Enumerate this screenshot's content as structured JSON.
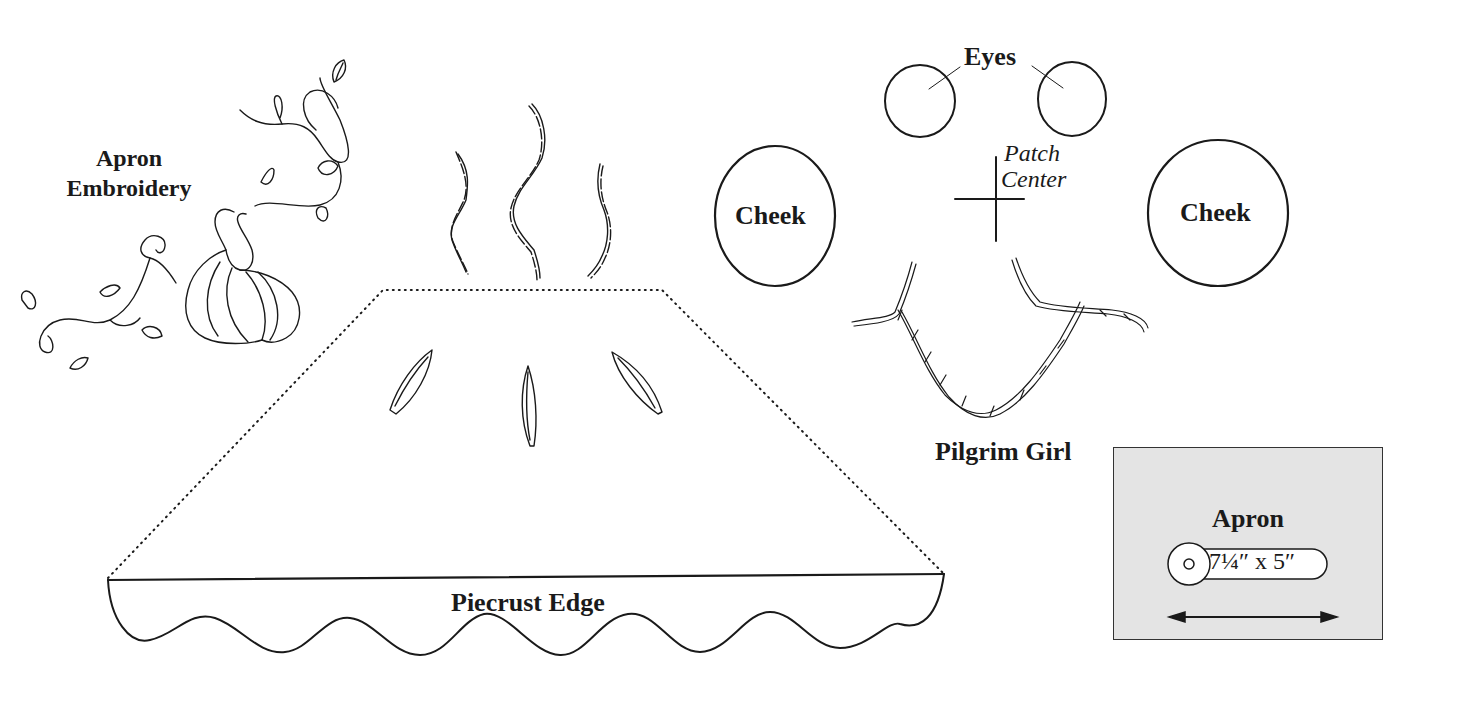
{
  "labels": {
    "apron_embroidery_line1": "Apron",
    "apron_embroidery_line2": "Embroidery",
    "eyes": "Eyes",
    "patch_center_line1": "Patch",
    "patch_center_line2": "Center",
    "cheek_left": "Cheek",
    "cheek_right": "Cheek",
    "pilgrim_girl": "Pilgrim Girl",
    "piecrust_edge": "Piecrust Edge"
  },
  "apron_card": {
    "title": "Apron",
    "size": "7¼″ x 5″",
    "icon": "circle-target-icon",
    "arrow": "double-headed-arrow-icon",
    "background": "#e4e4e4"
  },
  "colors": {
    "ink": "#1a1a1a",
    "card_fill": "#e4e4e4"
  }
}
